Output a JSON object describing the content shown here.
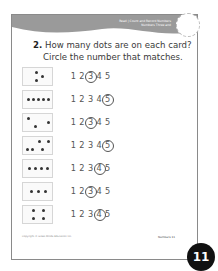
{
  "header": {
    "lesson_label": "Read",
    "subtitle_line1": "Count and Record Numbers",
    "subtitle_line2": "Numbers Three and",
    "band_color": "#9a9a9a"
  },
  "question": {
    "number": "2.",
    "line1": "How many dots are on each card?",
    "line2": "Circle the number that matches."
  },
  "rows": [
    {
      "dots": 3,
      "choices": [
        "1",
        "2",
        "3",
        "4",
        "5"
      ],
      "answer": "3"
    },
    {
      "dots": 5,
      "choices": [
        "1",
        "2",
        "3",
        "4",
        "5"
      ],
      "answer": "5"
    },
    {
      "dots": 3,
      "choices": [
        "1",
        "2",
        "3",
        "4",
        "5"
      ],
      "answer": "3"
    },
    {
      "dots": 5,
      "choices": [
        "1",
        "2",
        "3",
        "4",
        "5"
      ],
      "answer": "5"
    },
    {
      "dots": 4,
      "choices": [
        "1",
        "2",
        "3",
        "4",
        "5"
      ],
      "answer": "4"
    },
    {
      "dots": 3,
      "choices": [
        "1",
        "2",
        "3",
        "4",
        "5"
      ],
      "answer": "3"
    },
    {
      "dots": 4,
      "choices": [
        "1",
        "2",
        "3",
        "4",
        "5"
      ],
      "answer": "4"
    }
  ],
  "footer": {
    "copyright": "Copyright © Great Minds Education Inc.",
    "section": "Numbers",
    "page_small": "11",
    "page_badge": "11"
  }
}
